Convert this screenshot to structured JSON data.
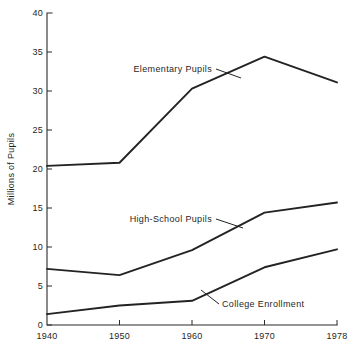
{
  "chart_data": {
    "type": "line",
    "title": "",
    "subtitle": "",
    "xlabel": "",
    "ylabel": "Millions of Pupils",
    "categories": [
      "1940",
      "1950",
      "1960",
      "1970",
      "1978"
    ],
    "x_tick_labels": [
      "1940",
      "1950",
      "1960",
      "1970",
      "1978"
    ],
    "y_tick_labels": [
      "0",
      "5",
      "10",
      "15",
      "20",
      "25",
      "30",
      "35",
      "40"
    ],
    "y_ticks": [
      0,
      5,
      10,
      15,
      20,
      25,
      30,
      35,
      40
    ],
    "ylim": [
      0,
      40
    ],
    "grid": false,
    "legend_position": "inline-annotations",
    "series": [
      {
        "name": "Elementary Pupils",
        "values": [
          20.4,
          20.8,
          30.3,
          34.4,
          31.1
        ]
      },
      {
        "name": "High-School Pupils",
        "values": [
          7.2,
          6.4,
          9.6,
          14.4,
          15.7
        ]
      },
      {
        "name": "College Enrollment",
        "values": [
          1.4,
          2.5,
          3.1,
          7.4,
          9.7
        ]
      }
    ],
    "annotations": [
      {
        "label": "Elementary Pupils",
        "series": "Elementary Pupils",
        "text_x": 212,
        "text_y": 72,
        "align": "end",
        "leader_from_x": 216,
        "leader_from_y": 69,
        "leader_to_x": 241,
        "leader_to_y": 78
      },
      {
        "label": "High-School Pupils",
        "series": "High-School Pupils",
        "text_x": 212,
        "text_y": 222,
        "align": "end",
        "leader_from_x": 216,
        "leader_from_y": 219,
        "leader_to_x": 243,
        "leader_to_y": 228
      },
      {
        "label": "College Enrollment",
        "series": "College Enrollment",
        "text_x": 222,
        "text_y": 307,
        "align": "start",
        "leader_from_x": 219,
        "leader_from_y": 304,
        "leader_to_x": 201,
        "leader_to_y": 290
      }
    ],
    "colors": {
      "line": "#232323",
      "axis": "#2b2b2b",
      "text": "#1f1f1f",
      "background": "#ffffff"
    }
  },
  "layout": {
    "plot_left": 47,
    "plot_right": 337,
    "plot_top": 13,
    "plot_bottom": 325
  }
}
